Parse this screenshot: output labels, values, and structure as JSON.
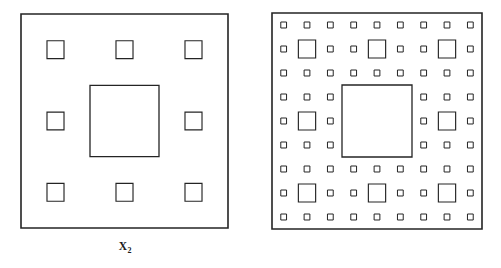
{
  "figure": {
    "background_color": "#ffffff",
    "stroke_color": "#242424",
    "panels": [
      {
        "id": "x2",
        "label_base": "X",
        "label_subscript": "2",
        "iteration": 2,
        "description": "Second iteration of the Sierpinski carpet: one large central square hole surrounded by eight smaller square holes.",
        "frame": {
          "x": 21,
          "y": 14,
          "width": 207,
          "height": 214
        },
        "holes_level_1": 1,
        "holes_level_2": 8,
        "holes_level_3": 0,
        "total_squares_drawn": 10
      },
      {
        "id": "x3",
        "label_base": "X",
        "label_subscript": "3",
        "iteration": 3,
        "description": "Third iteration of the Sierpinski carpet: one large central square hole, eight medium square holes, and sixty-four small square holes.",
        "frame": {
          "x": 21,
          "y": 13,
          "width": 210,
          "height": 216
        },
        "holes_level_1": 1,
        "holes_level_2": 8,
        "holes_level_3": 64,
        "total_squares_drawn": 73
      }
    ]
  },
  "chart_data": {
    "type": "diagram",
    "subtitle": "",
    "xlabel": "",
    "ylabel": "",
    "categories": [
      "X2",
      "X3"
    ],
    "series": [
      {
        "name": "level-1 central holes",
        "values": [
          1,
          1
        ]
      },
      {
        "name": "level-2 holes",
        "values": [
          8,
          8
        ]
      },
      {
        "name": "level-3 holes",
        "values": [
          0,
          64
        ]
      }
    ],
    "annotations": [
      "X2",
      "X3"
    ],
    "legend": "none",
    "grid": false
  }
}
